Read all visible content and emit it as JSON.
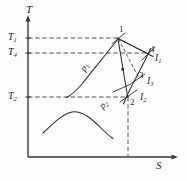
{
  "figure": {
    "kind": "temperature-entropy-diagram",
    "background_color": "#fdfdfd",
    "line_color": "#2b2b2b",
    "axes": {
      "y_label": "T",
      "x_label": "S",
      "origin_px": [
        28,
        157
      ],
      "y_top_px": 16,
      "x_right_px": 178
    },
    "ticks": {
      "y": [
        {
          "id": "T1",
          "base": "T",
          "sub": "1",
          "y_px": 38
        },
        {
          "id": "T4",
          "base": "T",
          "sub": "4",
          "y_px": 53
        },
        {
          "id": "T2",
          "base": "T",
          "sub": "2",
          "y_px": 97
        }
      ]
    },
    "state_points": [
      {
        "id": "1",
        "label": "1",
        "x_px": 118,
        "y_px": 38
      },
      {
        "id": "2",
        "label": "2",
        "x_px": 128,
        "y_px": 97
      },
      {
        "id": "3",
        "label": "3",
        "x_px": 140,
        "y_px": 78
      },
      {
        "id": "4",
        "label": "4",
        "x_px": 149,
        "y_px": 53
      }
    ],
    "isobars": [
      {
        "id": "p1",
        "base": "p",
        "sub": "1",
        "x_px": 80,
        "y_px": 66
      },
      {
        "id": "p2",
        "base": "p",
        "sub": "2",
        "x_px": 100,
        "y_px": 100
      }
    ],
    "enthalpy_labels": [
      {
        "id": "I1",
        "base": "I",
        "sub": "1",
        "x_px": 155,
        "y_px": 58
      },
      {
        "id": "I3",
        "base": "I",
        "sub": "3",
        "x_px": 146,
        "y_px": 82
      },
      {
        "id": "I2",
        "base": "I",
        "sub": "2",
        "x_px": 140,
        "y_px": 94
      }
    ],
    "dashed_guides": [
      {
        "id": "T1-guide",
        "from": [
          28,
          38
        ],
        "to": [
          118,
          38
        ]
      },
      {
        "id": "T4-guide",
        "from": [
          28,
          53
        ],
        "to": [
          149,
          53
        ]
      },
      {
        "id": "T2-guide",
        "from": [
          28,
          97
        ],
        "to": [
          128,
          97
        ]
      },
      {
        "id": "S2-guide",
        "from": [
          128,
          97
        ],
        "to": [
          128,
          157
        ]
      },
      {
        "id": "1-to-4-expansion",
        "from": [
          118,
          38
        ],
        "to": [
          149,
          53
        ]
      },
      {
        "id": "1-to-3-expansion",
        "from": [
          118,
          38
        ],
        "to": [
          140,
          78
        ]
      }
    ],
    "solid_process_lines": [
      {
        "id": "1-to-2-isentropic",
        "from": [
          118,
          38
        ],
        "to": [
          128,
          97
        ]
      },
      {
        "id": "1-to-4-actual",
        "from": [
          118,
          38
        ],
        "to": [
          152,
          56
        ]
      },
      {
        "id": "p1-isobar",
        "note": "curve from point 1 down-left to T2 level"
      },
      {
        "id": "p2-isobar",
        "note": "curve through points 2, 3, 4"
      },
      {
        "id": "saturation-dome",
        "note": "bell curve in lower region"
      }
    ],
    "tick_marks": [
      {
        "id": "tick-at-1"
      },
      {
        "id": "tick-at-2"
      },
      {
        "id": "tick-at-3"
      },
      {
        "id": "tick-at-4"
      }
    ]
  }
}
